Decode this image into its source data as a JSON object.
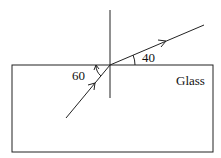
{
  "diagram": {
    "type": "refraction",
    "medium_label": "Glass",
    "angles": {
      "incident_angle_label": "60",
      "refracted_angle_label": "40"
    },
    "colors": {
      "line": "#111111",
      "background": "#ffffff"
    }
  }
}
